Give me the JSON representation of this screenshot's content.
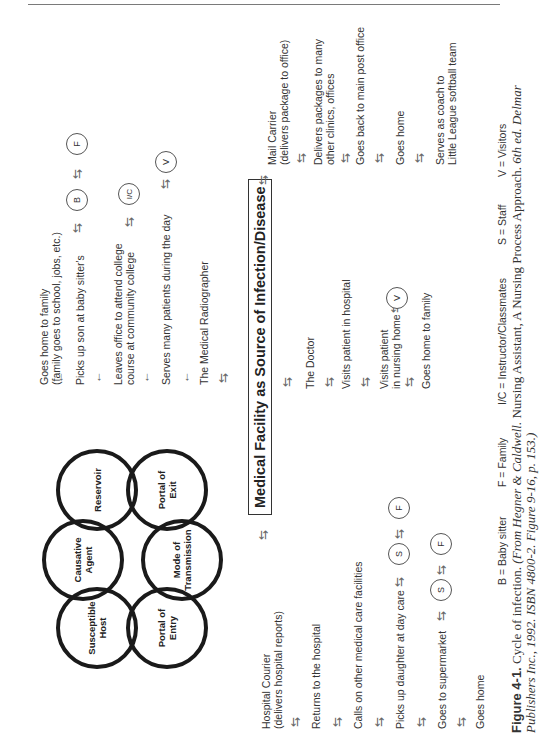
{
  "figure": {
    "number": "Figure 4-1.",
    "caption_title": "Cycle of infection.",
    "caption_source_italic_1": "(From Hegner & Caldwell.",
    "caption_source_plain": "Nursing Assistant, A Nursing Process Approach.",
    "caption_source_italic_2": "6th ed. Delmar",
    "caption_line2": "Publishers Inc., 1992. ISBN 4800-2. Figure 9-16, p. 153.)"
  },
  "central_box": "Medical Facility as Source of Infection/Disease",
  "chain_of_infection": [
    {
      "id": "reservoir",
      "lines": [
        "Reservoir"
      ]
    },
    {
      "id": "portal-of-exit",
      "lines": [
        "Portal of",
        "Exit"
      ]
    },
    {
      "id": "causative-agent",
      "lines": [
        "Causative",
        "Agent"
      ]
    },
    {
      "id": "mode-of-transmission",
      "lines": [
        "Mode of",
        "Transmission"
      ]
    },
    {
      "id": "susceptible-host",
      "lines": [
        "Susceptible",
        "Host"
      ]
    },
    {
      "id": "portal-of-entry",
      "lines": [
        "Portal of",
        "Entry"
      ]
    }
  ],
  "radiographer_path": {
    "items": [
      {
        "lines": [
          "Goes home to family",
          "(family goes to school, jobs, etc.)"
        ]
      },
      {
        "lines": [
          "Picks up son at baby sitter's"
        ],
        "badges": [
          "B",
          "F"
        ]
      },
      {
        "lines": [
          "Leaves office to attend college",
          "course at community college"
        ],
        "badges": [
          "I/C"
        ]
      },
      {
        "lines": [
          "Serves many patients during the day"
        ],
        "badges": [
          "V"
        ]
      },
      {
        "lines": [
          "The Medical Radiographer"
        ]
      }
    ]
  },
  "mail_carrier_path": {
    "items": [
      {
        "lines": [
          "Mail Carrier",
          "(delivers package to office)"
        ]
      },
      {
        "lines": [
          "Delivers packages to many",
          "other clinics, offices"
        ]
      },
      {
        "lines": [
          "Goes back to main post office"
        ]
      },
      {
        "lines": [
          "Goes home"
        ]
      },
      {
        "lines": [
          "Serves as coach to",
          "Little League softball team"
        ]
      }
    ]
  },
  "doctor_path": {
    "items": [
      {
        "lines": [
          "The Doctor"
        ]
      },
      {
        "lines": [
          "Visits patient in hospital"
        ]
      },
      {
        "lines": [
          "Visits patient",
          "in nursing home"
        ],
        "badges": [
          "V"
        ]
      },
      {
        "lines": [
          "Goes home to family"
        ]
      }
    ]
  },
  "courier_path": {
    "items": [
      {
        "lines": [
          "Hospital Courier",
          "(delivers hospital reports)"
        ]
      },
      {
        "lines": [
          "Returns to the hospital"
        ]
      },
      {
        "lines": [
          "Calls on other medical care facilities"
        ]
      },
      {
        "lines": [
          "Picks up daughter at day care"
        ],
        "badges": [
          "S",
          "F"
        ]
      },
      {
        "lines": [
          "Goes to supermarket"
        ],
        "badges": [
          "S",
          "F"
        ]
      },
      {
        "lines": [
          "Goes home"
        ]
      }
    ]
  },
  "legend": [
    "B = Baby sitter",
    "F = Family",
    "I/C = Instructor/Classmates",
    "S = Staff",
    "V = Visitors"
  ]
}
